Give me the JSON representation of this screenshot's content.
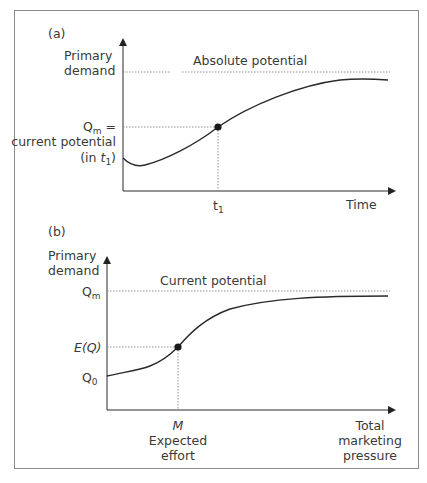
{
  "panel_a": {
    "tag": "(a)",
    "y_label_1": "Primary",
    "y_label_2": "demand",
    "ref_line_label": "Absolute potential",
    "qm_label_main": "Q",
    "qm_label_sub": "m",
    "qm_label_suffix": " =",
    "qm_desc_1": "current potential",
    "qm_desc_2_prefix": "(in ",
    "qm_desc_2_var": "t",
    "qm_desc_2_sub": "1",
    "qm_desc_2_suffix": ")",
    "x_marker": "t",
    "x_marker_sub": "1",
    "x_label": "Time"
  },
  "panel_b": {
    "tag": "(b)",
    "y_label_1": "Primary",
    "y_label_2": "demand",
    "ref_line_label": "Current potential",
    "qm_main": "Q",
    "qm_sub": "m",
    "eq_label": "E(Q)",
    "q0_main": "Q",
    "q0_sub": "0",
    "x_marker": "M",
    "x_marker_desc_1": "Expected",
    "x_marker_desc_2": "effort",
    "x_label_1": "Total",
    "x_label_2": "marketing",
    "x_label_3": "pressure"
  },
  "colors": {
    "line": "#2a2a2a",
    "text": "#3a3a3a",
    "dotted": "#777777",
    "frame": "#8a8a8a"
  }
}
